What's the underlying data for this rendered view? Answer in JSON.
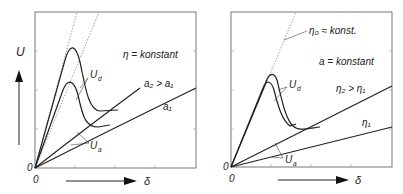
{
  "left_panel": {
    "y_axis_label": "U",
    "x_axis_label": "δ",
    "origin_y": "0",
    "origin_x": "0",
    "condition": "η = konstant",
    "curve_upper": "a₂ > a₁",
    "curve_lower": "a₁",
    "peak_label": "U",
    "peak_sub": "d",
    "static_label": "U",
    "static_sub": "a"
  },
  "right_panel": {
    "x_axis_label": "δ",
    "origin_y": "0",
    "origin_x": "0",
    "asymptote": "η₀ ≈ konst.",
    "condition": "a = konstant",
    "curve_upper": "η₂ > η₁",
    "curve_lower": "η₁",
    "peak_label": "U",
    "peak_sub": "d",
    "static_label": "U",
    "static_sub": "a"
  },
  "colors": {
    "line": "#222222",
    "frame": "#555555",
    "dotted": "#777777"
  }
}
